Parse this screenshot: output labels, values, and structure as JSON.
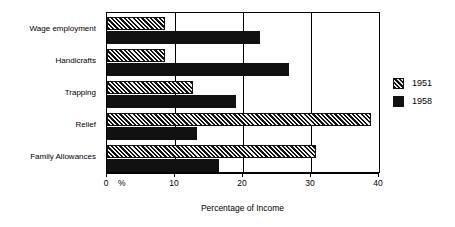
{
  "chart_data": {
    "type": "bar",
    "orientation": "horizontal",
    "title": "",
    "xlabel": "Percentage of Income",
    "ylabel": "",
    "xlim": [
      0,
      40
    ],
    "xticks": [
      0,
      10,
      20,
      30,
      40
    ],
    "xtick_labels": [
      "0",
      "10",
      "20",
      "30",
      "40"
    ],
    "x_unit_mark": "%",
    "grid": true,
    "grid_axis": "x",
    "legend_position": "right",
    "categories": [
      "Wage employment",
      "Handicrafts",
      "Trapping",
      "Relief",
      "Family Allowances"
    ],
    "series": [
      {
        "name": "1951",
        "fill": "hatched",
        "color": "#111111",
        "values": [
          8.6,
          8.5,
          12.6,
          38.8,
          30.8
        ]
      },
      {
        "name": "1958",
        "fill": "solid",
        "color": "#111111",
        "values": [
          22.5,
          26.7,
          18.9,
          13.3,
          16.5
        ]
      }
    ]
  },
  "legend": {
    "entries": [
      {
        "label": "1951",
        "swatch": "hatched-swatch"
      },
      {
        "label": "1958",
        "swatch": "solid-swatch"
      }
    ]
  },
  "axis": {
    "x_title": "Percentage of Income",
    "percent_symbol": "%"
  }
}
